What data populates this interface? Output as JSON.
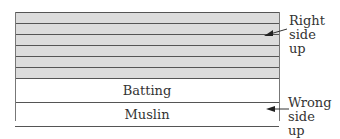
{
  "diagram": {
    "strips": [
      "",
      "",
      "",
      "",
      "",
      ""
    ],
    "layers": {
      "batting": "Batting",
      "muslin": "Muslin"
    },
    "labels": {
      "right_side_up": "Right\nside\nup",
      "wrong_side_up": "Wrong\nside\nup"
    },
    "colors": {
      "strip_fill": "#dcdcdc",
      "line": "#555555"
    }
  }
}
